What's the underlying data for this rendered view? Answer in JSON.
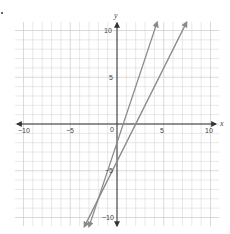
{
  "chart_data": {
    "type": "line",
    "title": "",
    "xlabel": "x",
    "ylabel": "y",
    "xlim": [
      -10,
      10
    ],
    "ylim": [
      -10,
      10
    ],
    "grid": true,
    "x_ticks": [
      "-10",
      "-5",
      "0",
      "5",
      "10"
    ],
    "y_ticks": [
      "10",
      "5",
      "-5",
      "-10"
    ],
    "origin_label": "0",
    "series": [
      {
        "name": "line 1",
        "equation": "y = 3x - 2",
        "slope": 3,
        "intercept": -2,
        "arrows": "both",
        "color": "#8a8a8a"
      },
      {
        "name": "line 2",
        "equation": "y = 2x - 4",
        "slope": 2,
        "intercept": -4,
        "arrows": "both",
        "color": "#8a8a8a"
      }
    ]
  },
  "labels": {
    "x_axis": "x",
    "y_axis": "y",
    "origin": "0",
    "xt_m10": "−10",
    "xt_m5": "−5",
    "xt_5": "5",
    "xt_10": "10",
    "yt_10": "10",
    "yt_5": "5",
    "yt_m5": "−5",
    "yt_m10": "−10"
  },
  "colors": {
    "grid": "#d0d0d0",
    "axis": "#333333",
    "line": "#8a8a8a"
  }
}
